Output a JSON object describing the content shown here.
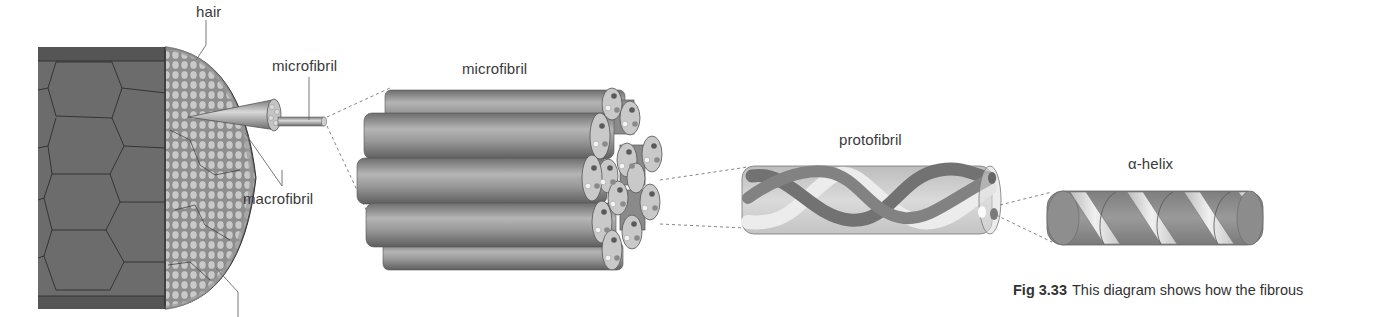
{
  "labels": {
    "hair": "hair",
    "microfibril_small": "microfibril",
    "macrofibril": "macrofibril",
    "microfibril_large": "microfibril",
    "protofibril": "protofibril",
    "alpha_helix": "α-helix"
  },
  "caption": {
    "figure_number": "Fig 3.33",
    "text": "This diagram shows how the fibrous"
  },
  "colors": {
    "hair_cortex": "#6e6e6e",
    "hair_cuticle": "#5a5a5a",
    "cell_lines": "#2a2a2a",
    "macrofibril_cross_section": "#c8c8c8",
    "microfibril_rod": "#8c8c8c",
    "protofibril_tube": "#d4d4d4",
    "protofibril_dark_strand": "#707070",
    "protofibril_light_strand": "#e6e6e6",
    "helix_cylinder": "#8a8a8a",
    "helix_ribbon": "#e0e0e0",
    "leader_lines": "#666666"
  }
}
